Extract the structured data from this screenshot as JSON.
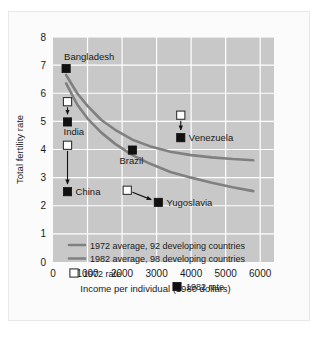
{
  "chart_data": {
    "type": "scatter",
    "title": "",
    "xlabel": "Income per individual (1980 dollars)",
    "ylabel": "Total fertility rate",
    "xlim": [
      0,
      6400
    ],
    "ylim": [
      0,
      8
    ],
    "xticks": [
      "0",
      "1000",
      "2000",
      "3000",
      "4000",
      "5000",
      "6000"
    ],
    "xtick_values": [
      0,
      1000,
      2000,
      3000,
      4000,
      5000,
      6000
    ],
    "yticks": [
      "0",
      "1",
      "2",
      "3",
      "4",
      "5",
      "6",
      "7",
      "8"
    ],
    "ytick_values": [
      0,
      1,
      2,
      3,
      4,
      5,
      6,
      7,
      8
    ],
    "grid": true,
    "legend_position": "inside-lower-left",
    "plot_background": "#c8c8c8",
    "gridline_color": "#ffffff",
    "curve_color": "#808080",
    "marker_1972_fill": "#ffffff",
    "marker_1982_fill": "#111111",
    "series": [
      {
        "name": "1972 average, 92 developing countries",
        "type": "line",
        "x": [
          380,
          700,
          1000,
          1400,
          1800,
          2300,
          2800,
          3400,
          4000,
          4600,
          5200,
          5800
        ],
        "values": [
          6.65,
          6.0,
          5.55,
          5.05,
          4.7,
          4.35,
          4.12,
          3.92,
          3.8,
          3.72,
          3.66,
          3.62
        ]
      },
      {
        "name": "1982 average, 98 developing countries",
        "type": "line",
        "x": [
          380,
          700,
          1000,
          1400,
          1800,
          2300,
          2800,
          3400,
          4000,
          4600,
          5200,
          5800
        ],
        "values": [
          6.35,
          5.6,
          5.1,
          4.6,
          4.2,
          3.8,
          3.5,
          3.2,
          3.0,
          2.82,
          2.66,
          2.52
        ]
      }
    ],
    "points": [
      {
        "label": "Bangladesh",
        "label_pos": "above-right",
        "income_1982": 380,
        "rate_1972": null,
        "rate_1982": 6.88,
        "arrow": false
      },
      {
        "label": "India",
        "label_pos": "below-right",
        "income_1982": 420,
        "rate_1972": 5.7,
        "rate_1982": 4.98,
        "arrow": true
      },
      {
        "label": "China",
        "label_pos": "right",
        "income_1982": 420,
        "rate_1972": 4.15,
        "rate_1982": 2.5,
        "arrow": true
      },
      {
        "label": "Brazil",
        "label_pos": "below",
        "income_1982": 2300,
        "rate_1972": null,
        "rate_1982": 3.98,
        "arrow": false
      },
      {
        "label": "Venezuela",
        "label_pos": "right",
        "income_1982": 3700,
        "rate_1972": 5.22,
        "rate_1982": 4.42,
        "arrow": true
      },
      {
        "label": "Yugoslavia",
        "label_pos": "right",
        "income_1972": 2150,
        "income_1982": 3050,
        "rate_1972": 2.55,
        "rate_1982": 2.12,
        "arrow": true
      }
    ],
    "legend": [
      {
        "type": "line",
        "label": "1972 average, 92 developing countries"
      },
      {
        "type": "line",
        "label": "1982 average, 98 developing countries"
      },
      {
        "type": "marker-open",
        "label": "1972 rate"
      },
      {
        "type": "marker-filled",
        "label": "1982 rate"
      }
    ]
  }
}
